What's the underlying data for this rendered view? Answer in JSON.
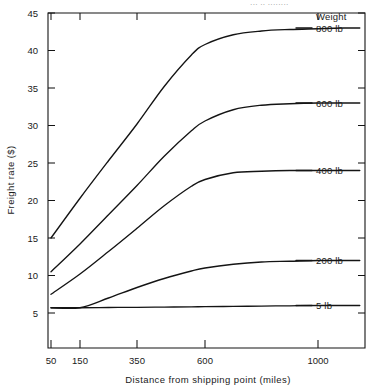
{
  "top_cropped_text": "··· ·· ········",
  "chart_data": {
    "type": "line",
    "title": "",
    "xlabel": "Distance from shipping point (miles)",
    "ylabel": "Freight rate ($)",
    "legend_title": "Weight",
    "legend_position": "right-of-curve-ends",
    "grid": false,
    "xticks": [
      50,
      150,
      350,
      600,
      1000
    ],
    "xtick_labels": [
      "50",
      "150",
      "350",
      "600",
      "1000"
    ],
    "yticks": [
      5,
      10,
      15,
      20,
      25,
      30,
      35,
      40,
      45
    ],
    "ytick_labels": [
      "5",
      "10",
      "15",
      "20",
      "25",
      "30",
      "35",
      "40",
      "45"
    ],
    "xlim": [
      50,
      1180
    ],
    "ylim": [
      3.0,
      45
    ],
    "series": [
      {
        "name": "800 lb",
        "label": "800 lb",
        "x": [
          50,
          150,
          250,
          350,
          450,
          550,
          600,
          700,
          800,
          900,
          1000,
          1100,
          1160
        ],
        "values": [
          15.0,
          20.3,
          25.3,
          30.2,
          35.2,
          39.4,
          40.8,
          42.1,
          42.6,
          42.8,
          42.9,
          43.0,
          43.0
        ]
      },
      {
        "name": "600 lb",
        "label": "600 lb",
        "x": [
          50,
          150,
          250,
          350,
          450,
          550,
          600,
          700,
          800,
          900,
          1000,
          1100,
          1160
        ],
        "values": [
          10.5,
          14.2,
          18.1,
          22.0,
          25.9,
          29.3,
          30.6,
          32.1,
          32.7,
          32.9,
          33.0,
          33.0,
          33.0
        ]
      },
      {
        "name": "400 lb",
        "label": "400 lb",
        "x": [
          50,
          150,
          250,
          350,
          450,
          550,
          600,
          700,
          800,
          900,
          1000,
          1100,
          1160
        ],
        "values": [
          7.5,
          10.2,
          13.2,
          16.3,
          19.3,
          21.9,
          22.8,
          23.7,
          23.9,
          24.0,
          24.0,
          24.0,
          24.0
        ]
      },
      {
        "name": "200 lb",
        "label": "200 lb",
        "x": [
          50,
          150,
          250,
          350,
          450,
          550,
          600,
          700,
          800,
          900,
          1000,
          1100,
          1160
        ],
        "values": [
          5.7,
          5.7,
          7.0,
          8.4,
          9.6,
          10.6,
          11.0,
          11.5,
          11.8,
          11.9,
          12.0,
          12.0,
          12.0
        ]
      },
      {
        "name": "5 lb",
        "label": "5 lb",
        "x": [
          50,
          150,
          250,
          350,
          450,
          550,
          600,
          700,
          800,
          900,
          1000,
          1100,
          1160
        ],
        "values": [
          5.7,
          5.7,
          5.73,
          5.76,
          5.79,
          5.82,
          5.84,
          5.88,
          5.92,
          5.96,
          6.0,
          6.0,
          6.0
        ]
      }
    ],
    "colors": {
      "curve": "#141414",
      "axis": "#141414",
      "text": "#1a1a1a",
      "background": "#ffffff"
    }
  }
}
